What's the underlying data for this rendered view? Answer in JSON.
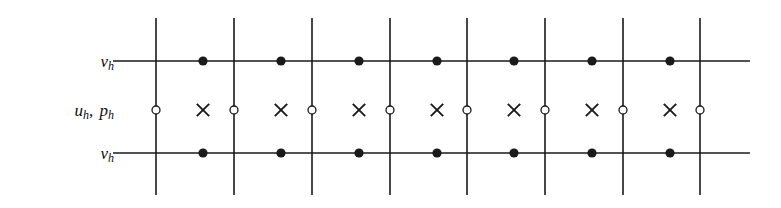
{
  "figure": {
    "background_color": "#ffffff",
    "ink_color": "#1a1a1a"
  },
  "labels": {
    "velocity_top": {
      "symbol": "v",
      "subscript": "h",
      "text": "v"
    },
    "velocity_bottom": {
      "symbol": "v",
      "subscript": "h",
      "text": "v"
    },
    "pressure_middle": {
      "first_symbol": "u",
      "first_subscript": "h",
      "separator": ", ",
      "second_symbol": "p",
      "second_subscript": "h"
    }
  },
  "legend_glyphs": {
    "filled_dot": "filled-circle",
    "open_circle": "open-circle",
    "cross": "times-cross"
  },
  "chart_data": {
    "type": "scatter",
    "xlabel": "",
    "ylabel": "",
    "grid": true,
    "xlim": [
      113,
      750
    ],
    "ylim": [
      18,
      195
    ],
    "axis_rows": [
      {
        "name": "v_h upper",
        "y": 61,
        "label": "v_h"
      },
      {
        "name": "u_h, p_h middle",
        "y": 110,
        "label": "u_h, p_h"
      },
      {
        "name": "v_h lower",
        "y": 153,
        "label": "v_h"
      }
    ],
    "gridlines": {
      "vertical_x": [
        156,
        234,
        312,
        390,
        467,
        545,
        623,
        700
      ],
      "vertical_y_start": 18,
      "vertical_y_end": 195,
      "horizontal_y": [
        61,
        153
      ],
      "horizontal_x_start": 113,
      "horizontal_x_end": 750
    },
    "series": [
      {
        "name": "v_h upper nodes",
        "marker": "filled-circle",
        "y": 61,
        "x": [
          203,
          281,
          359,
          437,
          514,
          592,
          670
        ]
      },
      {
        "name": "v_h lower nodes",
        "marker": "filled-circle",
        "y": 153,
        "x": [
          203,
          281,
          359,
          437,
          514,
          592,
          670
        ]
      },
      {
        "name": "u_h nodes",
        "marker": "open-circle",
        "y": 110,
        "x": [
          156,
          234,
          312,
          390,
          467,
          545,
          623,
          700
        ]
      },
      {
        "name": "p_h cell centers",
        "marker": "times-cross",
        "y": 110,
        "x": [
          203,
          281,
          359,
          437,
          514,
          592,
          670
        ]
      }
    ]
  }
}
